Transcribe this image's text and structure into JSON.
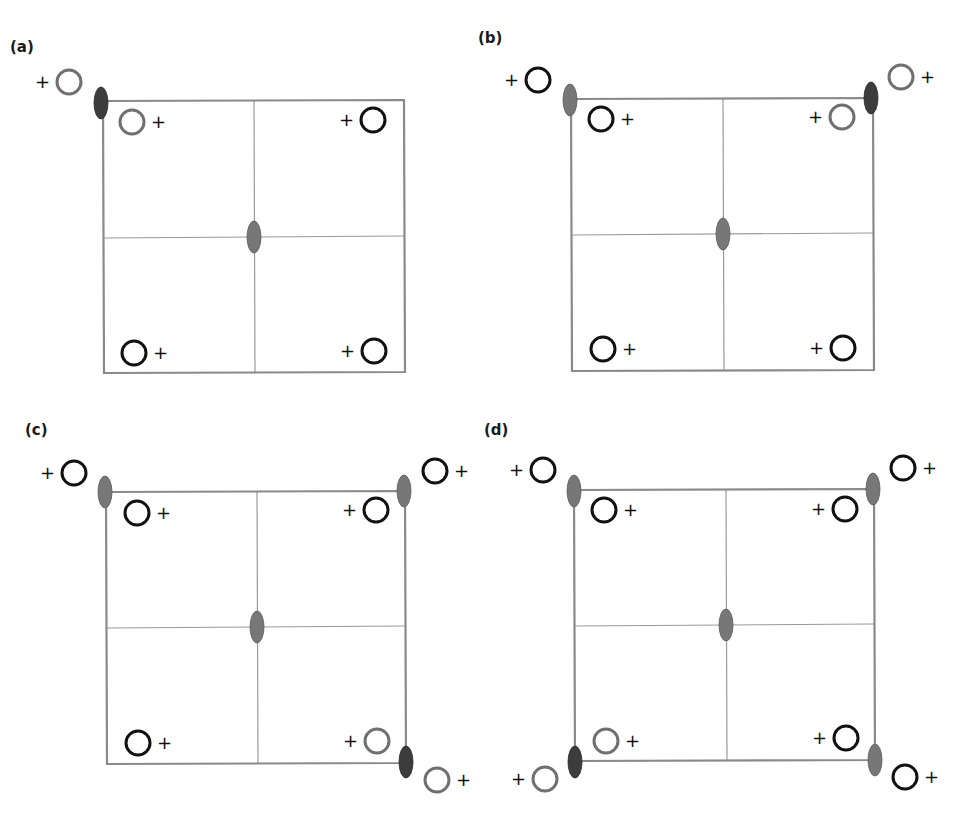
{
  "figure": {
    "colors": {
      "box_stroke": "#8a8a8a",
      "grid_stroke": "#9a9a9a",
      "ellipse_normal": "#777777",
      "ellipse_dark": "#3c3c3c",
      "circle_black": "#111111",
      "circle_gray": "#707070"
    },
    "panels": [
      {
        "label": "(a)",
        "label_pos": [
          10,
          107
        ],
        "box": [
          103,
          101,
          404,
          372
        ],
        "center": [
          254,
          237
        ],
        "ellipses": [
          {
            "pos": [
              101,
              103
            ],
            "shade": "dark"
          },
          {
            "pos": [
              254,
              237
            ],
            "shade": "normal"
          }
        ],
        "circles": [
          {
            "pos": [
              69,
              82
            ],
            "shade": "gray",
            "plus": "left"
          },
          {
            "pos": [
              132,
              122
            ],
            "shade": "gray",
            "plus": "right"
          },
          {
            "pos": [
              373,
              120
            ],
            "shade": "black",
            "plus": "left"
          },
          {
            "pos": [
              134,
              353
            ],
            "shade": "black",
            "plus": "right"
          },
          {
            "pos": [
              374,
              351
            ],
            "shade": "black",
            "plus": "left"
          }
        ]
      },
      {
        "label": "(b)",
        "label_pos": [
          478,
          45
        ],
        "box": [
          571,
          99,
          873,
          370
        ],
        "center": [
          723,
          234
        ],
        "ellipses": [
          {
            "pos": [
              570,
              100
            ],
            "shade": "normal"
          },
          {
            "pos": [
              871,
              98
            ],
            "shade": "dark"
          },
          {
            "pos": [
              723,
              234
            ],
            "shade": "normal"
          }
        ],
        "circles": [
          {
            "pos": [
              538,
              80
            ],
            "shade": "black",
            "plus": "left"
          },
          {
            "pos": [
              901,
              77
            ],
            "shade": "gray",
            "plus": "right"
          },
          {
            "pos": [
              601,
              119
            ],
            "shade": "black",
            "plus": "right"
          },
          {
            "pos": [
              842,
              117
            ],
            "shade": "gray",
            "plus": "left"
          },
          {
            "pos": [
              603,
              349
            ],
            "shade": "black",
            "plus": "right"
          },
          {
            "pos": [
              843,
              348
            ],
            "shade": "black",
            "plus": "left"
          }
        ]
      },
      {
        "label": "(c)",
        "label_pos": [
          25,
          437
        ],
        "box": [
          106,
          492,
          405,
          763
        ],
        "center": [
          257,
          627
        ],
        "ellipses": [
          {
            "pos": [
              105,
              492
            ],
            "shade": "normal"
          },
          {
            "pos": [
              404,
              491
            ],
            "shade": "normal"
          },
          {
            "pos": [
              406,
              762
            ],
            "shade": "dark"
          },
          {
            "pos": [
              257,
              627
            ],
            "shade": "normal"
          }
        ],
        "circles": [
          {
            "pos": [
              74,
              473
            ],
            "shade": "black",
            "plus": "left"
          },
          {
            "pos": [
              435,
              471
            ],
            "shade": "black",
            "plus": "right"
          },
          {
            "pos": [
              137,
              513
            ],
            "shade": "black",
            "plus": "right"
          },
          {
            "pos": [
              376,
              510
            ],
            "shade": "black",
            "plus": "left"
          },
          {
            "pos": [
              138,
              743
            ],
            "shade": "black",
            "plus": "right"
          },
          {
            "pos": [
              377,
              741
            ],
            "shade": "gray",
            "plus": "left"
          },
          {
            "pos": [
              437,
              780
            ],
            "shade": "gray",
            "plus": "right"
          }
        ]
      },
      {
        "label": "(d)",
        "label_pos": [
          484,
          437
        ],
        "box": [
          574,
          490,
          874,
          760
        ],
        "center": [
          726,
          625
        ],
        "ellipses": [
          {
            "pos": [
              574,
              491
            ],
            "shade": "normal"
          },
          {
            "pos": [
              873,
              489
            ],
            "shade": "normal"
          },
          {
            "pos": [
              575,
              762
            ],
            "shade": "dark"
          },
          {
            "pos": [
              875,
              760
            ],
            "shade": "normal"
          },
          {
            "pos": [
              726,
              625
            ],
            "shade": "normal"
          }
        ],
        "circles": [
          {
            "pos": [
              543,
              470
            ],
            "shade": "black",
            "plus": "left"
          },
          {
            "pos": [
              903,
              468
            ],
            "shade": "black",
            "plus": "right"
          },
          {
            "pos": [
              604,
              510
            ],
            "shade": "black",
            "plus": "right"
          },
          {
            "pos": [
              845,
              509
            ],
            "shade": "black",
            "plus": "left"
          },
          {
            "pos": [
              606,
              741
            ],
            "shade": "gray",
            "plus": "right"
          },
          {
            "pos": [
              846,
              738
            ],
            "shade": "black",
            "plus": "left"
          },
          {
            "pos": [
              545,
              779
            ],
            "shade": "gray",
            "plus": "left"
          },
          {
            "pos": [
              905,
              777
            ],
            "shade": "black",
            "plus": "right"
          }
        ]
      }
    ],
    "plus_symbol": "+"
  }
}
